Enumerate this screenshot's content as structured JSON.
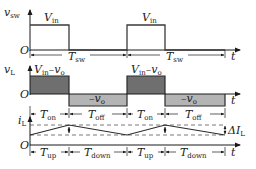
{
  "diagram": {
    "colors": {
      "line": "#3a3a3a",
      "vl_positive_fill": "#6f6f6f",
      "vl_negative_fill": "#b4b4b4",
      "dashed": "#555555",
      "background": "#ffffff"
    },
    "origin_label": "O",
    "time_axis_label": "t",
    "panels": {
      "vsw": {
        "y_label_main": "v",
        "y_label_sub": "sw",
        "level_label_main": "V",
        "level_label_sub": "in",
        "period_label_main": "T",
        "period_label_sub": "sw"
      },
      "vl": {
        "y_label_main": "v",
        "y_label_sub": "L",
        "high_label": {
          "a": "V",
          "a_sub": "in",
          "dash": "–",
          "b": "v",
          "b_sub": "o"
        },
        "low_label": {
          "dash": "–",
          "b": "v",
          "b_sub": "o"
        },
        "on_label_main": "T",
        "on_label_sub": "on",
        "off_label_main": "T",
        "off_label_sub": "off"
      },
      "il": {
        "y_label_main": "i",
        "y_label_sub": "L",
        "ripple_label_main": "ΔI",
        "ripple_label_sub": "L",
        "up_label_main": "T",
        "up_label_sub": "up",
        "down_label_main": "T",
        "down_label_sub": "down"
      }
    },
    "periods_shown": 2,
    "duty_cycle_approx": 0.4
  }
}
